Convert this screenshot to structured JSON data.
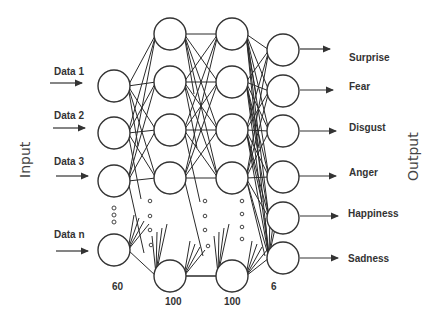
{
  "diagram": {
    "type": "neural-network",
    "side_labels": {
      "input": "Input",
      "output": "Output"
    },
    "input_labels": [
      "Data 1",
      "Data 2",
      "Data 3",
      "Data n"
    ],
    "output_labels": [
      "Surprise",
      "Fear",
      "Disgust",
      "Anger",
      "Happiness",
      "Sadness"
    ],
    "layer_sizes": [
      {
        "layer": "input",
        "count": "60"
      },
      {
        "layer": "hidden1",
        "count": "100"
      },
      {
        "layer": "hidden2",
        "count": "100"
      },
      {
        "layer": "output",
        "count": "6"
      }
    ],
    "colors": {
      "stroke": "#333333",
      "background": "#ffffff",
      "text": "#333333"
    }
  }
}
